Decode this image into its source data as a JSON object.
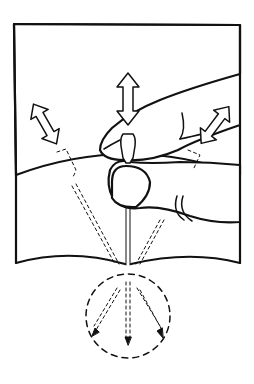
{
  "figure": {
    "type": "line-illustration",
    "colors": {
      "background": "#ffffff",
      "ink": "#111111"
    },
    "elements": {
      "panel": "rectangular sheet with curved bottom edge",
      "hand": "index finger and thumb pinching a needle",
      "needle": "vertical needle piercing panel bottom edge",
      "arrows": [
        "up-down double arrow above needle",
        "diagonal double arrow upper-left",
        "diagonal double arrow upper-right"
      ],
      "ghost_needles": [
        "dashed needle tilted left",
        "dashed needle tilted right"
      ],
      "motion_circle": "dashed circle below panel with three dashed arrows fanning down"
    }
  }
}
